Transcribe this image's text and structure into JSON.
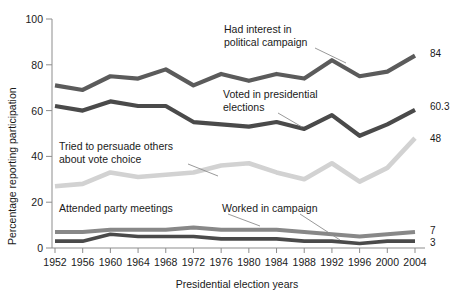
{
  "chart_data": {
    "type": "line",
    "title": "",
    "xlabel": "Presidential election years",
    "ylabel": "Percentage reporting participation",
    "categories": [
      "1952",
      "1956",
      "1960",
      "1964",
      "1968",
      "1972",
      "1976",
      "1980",
      "1984",
      "1988",
      "1992",
      "1996",
      "2000",
      "2004"
    ],
    "xlim": [
      1952,
      2004
    ],
    "ylim": [
      0,
      100
    ],
    "yticks": [
      0,
      20,
      40,
      60,
      80,
      100
    ],
    "grid": false,
    "legend": "inline-annotations",
    "series": [
      {
        "name": "Had interest in political campaign",
        "color": "#5b5b5b",
        "label_position": "above-right-of-line",
        "end_value_label": "84",
        "values": [
          71,
          69,
          75,
          74,
          78,
          71,
          76,
          73,
          76,
          74,
          82,
          75,
          77,
          84
        ]
      },
      {
        "name": "Voted in presidential elections",
        "color": "#4a4a4a",
        "label_position": "above-right-of-line",
        "end_value_label": "60.3",
        "values": [
          62,
          60,
          64,
          62,
          62,
          55,
          54,
          53,
          55,
          52,
          58,
          49,
          54,
          60.3
        ]
      },
      {
        "name": "Tried to persuade others about vote choice",
        "color": "#d2d2d2",
        "label_position": "above-left-of-line",
        "end_value_label": "48",
        "values": [
          27,
          28,
          33,
          31,
          32,
          33,
          36,
          37,
          33,
          30,
          37,
          29,
          35,
          48
        ]
      },
      {
        "name": "Attended party meetings",
        "color": "#888888",
        "label_position": "above-left-of-line",
        "end_value_label": "7",
        "values": [
          7,
          7,
          8,
          8,
          8,
          9,
          8,
          8,
          8,
          7,
          6,
          5,
          6,
          7
        ]
      },
      {
        "name": "Worked in campaign",
        "color": "#4a4a4a",
        "label_position": "above-right-of-line",
        "end_value_label": "3",
        "values": [
          3,
          3,
          6,
          5,
          5,
          5,
          4,
          4,
          4,
          3,
          3,
          2,
          3,
          3
        ]
      }
    ],
    "annotations": [
      {
        "text": "Had interest in",
        "line2": "political campaign"
      },
      {
        "text": "Voted in presidential",
        "line2": "elections"
      },
      {
        "text": "Tried to persuade others",
        "line2": "about vote choice"
      },
      {
        "text": "Attended party meetings",
        "line2": ""
      },
      {
        "text": "Worked in campaign",
        "line2": ""
      }
    ]
  },
  "labels": {
    "y_axis_title": "Percentage reporting participation",
    "x_axis_title": "Presidential election years",
    "yticks": [
      "0",
      "20",
      "40",
      "60",
      "80",
      "100"
    ],
    "xticks": [
      "1952",
      "1956",
      "1960",
      "1964",
      "1968",
      "1972",
      "1976",
      "1980",
      "1984",
      "1988",
      "1992",
      "1996",
      "2000",
      "2004"
    ],
    "ann_interest_1": "Had interest in",
    "ann_interest_2": "political campaign",
    "ann_voted_1": "Voted in presidential",
    "ann_voted_2": "elections",
    "ann_persuade_1": "Tried to persuade others",
    "ann_persuade_2": "about vote choice",
    "ann_meetings": "Attended party meetings",
    "ann_worked": "Worked in campaign",
    "end_interest": "84",
    "end_voted": "60.3",
    "end_persuade": "48",
    "end_meetings": "7",
    "end_worked": "3"
  }
}
